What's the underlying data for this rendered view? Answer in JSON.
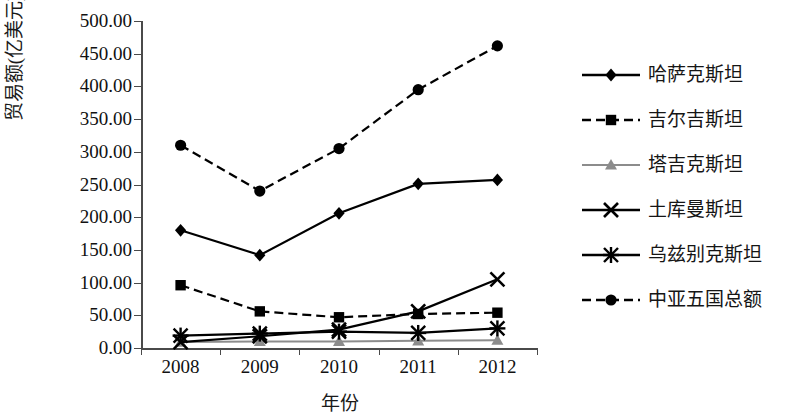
{
  "chart_data": {
    "type": "line",
    "title": "",
    "xlabel": "年份",
    "ylabel": "贸易额(亿美元)",
    "categories": [
      "2008",
      "2009",
      "2010",
      "2011",
      "2012"
    ],
    "ylim": [
      0,
      500
    ],
    "ytick_labels": [
      "500.00",
      "450.00",
      "400.00",
      "350.00",
      "300.00",
      "250.00",
      "200.00",
      "150.00",
      "100.00",
      "50.00",
      "0.00"
    ],
    "ytick_values": [
      500,
      450,
      400,
      350,
      300,
      250,
      200,
      150,
      100,
      50,
      0
    ],
    "grid": false,
    "legend_position": "right",
    "series": [
      {
        "name": "哈萨克斯坦",
        "marker": "diamond",
        "line": "solid",
        "color": "#000000",
        "values": [
          180,
          142,
          206,
          251,
          257
        ]
      },
      {
        "name": "吉尔吉斯坦",
        "marker": "square",
        "line": "dashed",
        "color": "#000000",
        "values": [
          96,
          56,
          47,
          52,
          54
        ]
      },
      {
        "name": "塔吉克斯坦",
        "marker": "triangle",
        "line": "solid",
        "color": "#8c8c8c",
        "values": [
          9,
          10,
          10,
          11,
          12
        ]
      },
      {
        "name": "土库曼斯坦",
        "marker": "cross",
        "line": "solid",
        "color": "#000000",
        "values": [
          9,
          18,
          28,
          56,
          105
        ]
      },
      {
        "name": "乌兹别克斯坦",
        "marker": "asterisk",
        "line": "solid",
        "color": "#000000",
        "values": [
          19,
          22,
          25,
          23,
          30
        ]
      },
      {
        "name": "中亚五国总额",
        "marker": "circle",
        "line": "dashed",
        "color": "#000000",
        "values": [
          310,
          240,
          305,
          395,
          462
        ]
      }
    ]
  },
  "axis": {
    "x_title": "年份",
    "y_title": "贸易额(亿美元)"
  }
}
